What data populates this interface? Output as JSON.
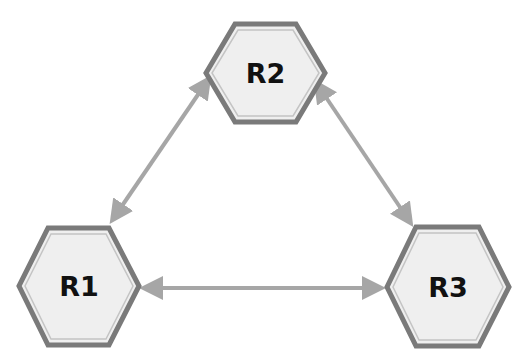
{
  "diagram": {
    "nodes": [
      {
        "id": "R2",
        "label": "R2"
      },
      {
        "id": "R1",
        "label": "R1"
      },
      {
        "id": "R3",
        "label": "R3"
      }
    ],
    "edges": [
      {
        "from": "R1",
        "to": "R2",
        "direction": "bidirectional"
      },
      {
        "from": "R2",
        "to": "R3",
        "direction": "bidirectional"
      },
      {
        "from": "R1",
        "to": "R3",
        "direction": "bidirectional"
      }
    ],
    "colors": {
      "node_fill": "#efefef",
      "node_border": "#7a7a7a",
      "arrow": "#a6a6a6",
      "text": "#111111"
    }
  }
}
